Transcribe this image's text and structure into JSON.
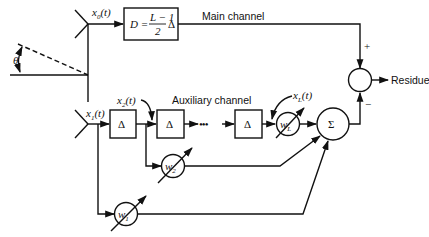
{
  "diagram": {
    "angle_label": "θ",
    "main_channel": {
      "signal_label": "x0(t)",
      "signal_var": "x",
      "signal_sub": "0",
      "signal_arg": "(t)",
      "delay_box": {
        "lhs": "D =",
        "num": "L − 1",
        "den": "2",
        "unit": "Δ"
      },
      "label": "Main channel"
    },
    "auxiliary_channel": {
      "label": "Auxiliary channel",
      "input_label": {
        "var": "x",
        "sub": "1",
        "arg": "(t)"
      },
      "tap2_label": {
        "var": "x",
        "sub": "2",
        "arg": "(t)"
      },
      "tapL_label": {
        "var": "x",
        "sub": "L",
        "arg": "(t)"
      },
      "delay_symbol": "Δ",
      "ellipsis": "•••",
      "weights": [
        {
          "var": "w",
          "sub": "1"
        },
        {
          "var": "w",
          "sub": "2"
        },
        {
          "var": "w",
          "sub": "L"
        }
      ],
      "sum_symbol": "Σ"
    },
    "combiner": {
      "plus": "+",
      "minus": "−",
      "output_label": "Residue"
    }
  }
}
